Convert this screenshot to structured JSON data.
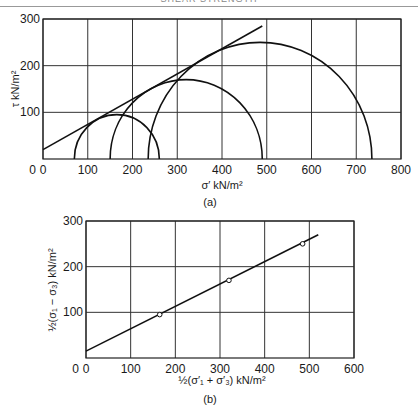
{
  "header": {
    "running_title": "SHEAR STRENGTH"
  },
  "chart_data": [
    {
      "id": "a",
      "type": "line",
      "caption": "(a)",
      "title": "",
      "xlabel": "σ′ kN/m²",
      "ylabel": "τ kN/m²",
      "xlim": [
        0,
        800
      ],
      "ylim": [
        0,
        300
      ],
      "xticks": [
        0,
        100,
        200,
        300,
        400,
        500,
        600,
        700,
        800
      ],
      "yticks": [
        100,
        200,
        300
      ],
      "grid": true,
      "mohr_circles": [
        {
          "sigma3": 70,
          "sigma1": 260,
          "center": 165,
          "radius": 95
        },
        {
          "sigma3": 150,
          "sigma1": 490,
          "center": 320,
          "radius": 170
        },
        {
          "sigma3": 235,
          "sigma1": 735,
          "center": 485,
          "radius": 250
        }
      ],
      "failure_envelope": {
        "x": [
          0,
          490
        ],
        "y": [
          20,
          285
        ]
      }
    },
    {
      "id": "b",
      "type": "scatter",
      "caption": "(b)",
      "title": "",
      "xlabel": "½(σ′₁ + σ′₃) kN/m²",
      "ylabel": "½(σ₁ − σ₃) kN/m²",
      "xlim": [
        0,
        600
      ],
      "ylim": [
        0,
        300
      ],
      "xticks": [
        0,
        100,
        200,
        300,
        400,
        500,
        600
      ],
      "yticks": [
        100,
        200,
        300
      ],
      "grid": true,
      "points": {
        "x": [
          165,
          320,
          485
        ],
        "y": [
          95,
          170,
          250
        ]
      },
      "fit_line": {
        "x": [
          0,
          520
        ],
        "y": [
          15,
          270
        ]
      }
    }
  ]
}
